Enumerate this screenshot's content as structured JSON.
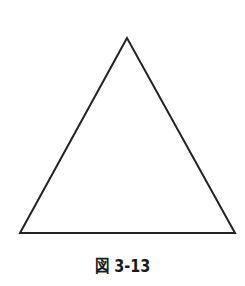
{
  "figure": {
    "caption": "図 3-13",
    "shape": "triangle",
    "vertices": [
      [
        127,
        38
      ],
      [
        20,
        233
      ],
      [
        235,
        233
      ]
    ],
    "stroke_color": "#222222",
    "fill_color": "#ffffff"
  }
}
